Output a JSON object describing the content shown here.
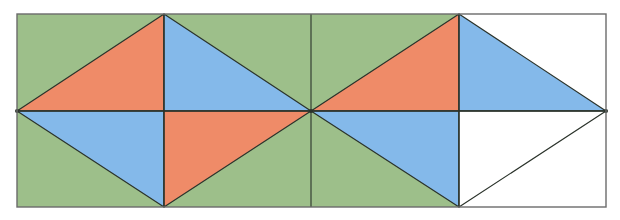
{
  "diagram": {
    "title": "",
    "colors": {
      "background_green": "#9dbf8a",
      "background_white": "#ffffff",
      "orange": "#ef8b68",
      "blue": "#84b9ea",
      "white": "#ffffff",
      "stroke": "#2b332b",
      "frame": "#6b6b6b"
    },
    "frame": {
      "x1": 17,
      "y1": 14,
      "x2": 606,
      "y2": 207
    },
    "midline_y": 111,
    "column_boundaries_x": [
      17,
      164,
      311,
      459,
      606
    ],
    "background_regions": [
      {
        "name": "green-region",
        "x1": 17,
        "x2": 459,
        "fill": "background_green"
      },
      {
        "name": "white-region",
        "x1": 459,
        "x2": 606,
        "fill": "background_white"
      }
    ],
    "triangles": [
      {
        "name": "rhombus1-top-left",
        "points": [
          [
            17,
            111
          ],
          [
            164,
            14
          ],
          [
            164,
            111
          ]
        ],
        "fill": "orange"
      },
      {
        "name": "rhombus1-top-right",
        "points": [
          [
            164,
            14
          ],
          [
            311,
            111
          ],
          [
            164,
            111
          ]
        ],
        "fill": "blue"
      },
      {
        "name": "rhombus1-bottom-left",
        "points": [
          [
            17,
            111
          ],
          [
            164,
            207
          ],
          [
            164,
            111
          ]
        ],
        "fill": "blue"
      },
      {
        "name": "rhombus1-bottom-right",
        "points": [
          [
            164,
            111
          ],
          [
            311,
            111
          ],
          [
            164,
            207
          ]
        ],
        "fill": "orange"
      },
      {
        "name": "rhombus2-top-left",
        "points": [
          [
            311,
            111
          ],
          [
            459,
            14
          ],
          [
            459,
            111
          ]
        ],
        "fill": "orange"
      },
      {
        "name": "rhombus2-top-right",
        "points": [
          [
            459,
            14
          ],
          [
            606,
            111
          ],
          [
            459,
            111
          ]
        ],
        "fill": "blue"
      },
      {
        "name": "rhombus2-bottom-left",
        "points": [
          [
            311,
            111
          ],
          [
            459,
            207
          ],
          [
            459,
            111
          ]
        ],
        "fill": "blue"
      },
      {
        "name": "rhombus2-bottom-right",
        "points": [
          [
            459,
            111
          ],
          [
            606,
            111
          ],
          [
            459,
            207
          ]
        ],
        "fill": "white"
      }
    ],
    "vertical_lines_x": [
      164,
      311,
      459
    ],
    "vertices": [
      {
        "name": "left-mid",
        "x": 17,
        "y": 111
      },
      {
        "name": "center-mid",
        "x": 311,
        "y": 111
      },
      {
        "name": "right-mid",
        "x": 606,
        "y": 111
      }
    ]
  }
}
